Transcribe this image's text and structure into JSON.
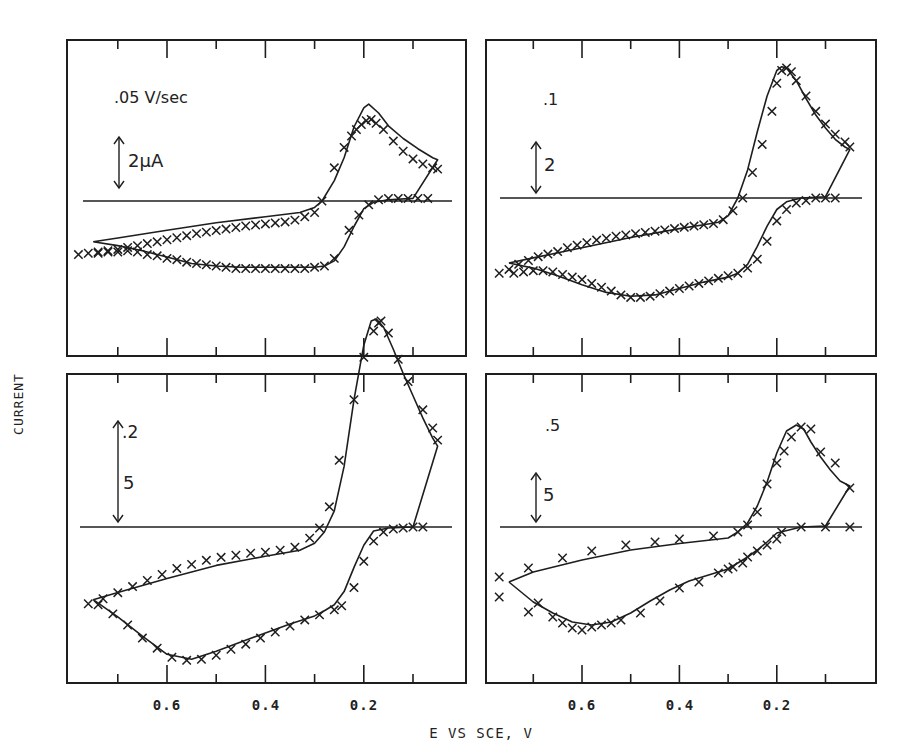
{
  "figure": {
    "ylabel": "CURRENT",
    "xlabel": "E VS SCE, V",
    "colors": {
      "ink": "#1e1e1e",
      "background": "#ffffff"
    }
  },
  "chart_data": [
    {
      "type": "line",
      "panel": "top-left",
      "title": ".05 V/sec",
      "scale_bar_label": "2μA",
      "scale_bar_value": 2,
      "xlabel": "E VS SCE, V",
      "ylabel": "CURRENT",
      "xlim": [
        0.8,
        0.0
      ],
      "x_ticks": [
        0.6,
        0.4,
        0.2
      ],
      "x_tick_labels": [],
      "series": [
        {
          "name": "simulated (solid line)",
          "style": "line",
          "x": [
            0.75,
            0.7,
            0.6,
            0.5,
            0.4,
            0.33,
            0.3,
            0.285,
            0.26,
            0.24,
            0.22,
            0.2,
            0.19,
            0.17,
            0.15,
            0.12,
            0.09,
            0.06,
            0.05,
            0.1,
            0.15,
            0.18,
            0.2,
            0.22,
            0.24,
            0.26,
            0.28,
            0.3,
            0.35,
            0.4,
            0.45,
            0.5,
            0.55,
            0.6,
            0.65,
            0.7,
            0.75
          ],
          "y": [
            -1.6,
            -1.45,
            -1.15,
            -0.85,
            -0.62,
            -0.45,
            -0.25,
            0.0,
            0.8,
            1.7,
            2.9,
            3.65,
            3.8,
            3.45,
            2.95,
            2.45,
            2.05,
            1.7,
            1.62,
            0.1,
            0.05,
            -0.05,
            -0.3,
            -1.0,
            -1.8,
            -2.35,
            -2.55,
            -2.6,
            -2.6,
            -2.6,
            -2.6,
            -2.55,
            -2.45,
            -2.2,
            -1.95,
            -1.75,
            -1.6
          ]
        },
        {
          "name": "experimental (x markers)",
          "style": "markers",
          "x": [
            0.78,
            0.76,
            0.74,
            0.72,
            0.7,
            0.68,
            0.66,
            0.64,
            0.62,
            0.6,
            0.58,
            0.56,
            0.54,
            0.52,
            0.5,
            0.48,
            0.46,
            0.44,
            0.42,
            0.4,
            0.38,
            0.36,
            0.34,
            0.32,
            0.3,
            0.285,
            0.26,
            0.24,
            0.225,
            0.215,
            0.205,
            0.195,
            0.185,
            0.175,
            0.16,
            0.14,
            0.12,
            0.1,
            0.08,
            0.06,
            0.05,
            0.07,
            0.09,
            0.11,
            0.13,
            0.15,
            0.17,
            0.19,
            0.21,
            0.23,
            0.26,
            0.28,
            0.3,
            0.32,
            0.34,
            0.36,
            0.38,
            0.4,
            0.42,
            0.44,
            0.46,
            0.48,
            0.5,
            0.52,
            0.54,
            0.56,
            0.58,
            0.6,
            0.62,
            0.64,
            0.66,
            0.68,
            0.7,
            0.72,
            0.74
          ],
          "y": [
            -2.1,
            -2.05,
            -2.0,
            -1.95,
            -1.9,
            -1.82,
            -1.75,
            -1.67,
            -1.6,
            -1.52,
            -1.44,
            -1.36,
            -1.28,
            -1.22,
            -1.16,
            -1.1,
            -1.04,
            -0.98,
            -0.94,
            -0.9,
            -0.86,
            -0.82,
            -0.75,
            -0.62,
            -0.45,
            0.0,
            1.3,
            2.1,
            2.55,
            2.8,
            3.0,
            3.15,
            3.2,
            3.05,
            2.8,
            2.35,
            1.95,
            1.65,
            1.45,
            1.3,
            1.25,
            0.1,
            0.1,
            0.1,
            0.1,
            0.1,
            0.05,
            -0.15,
            -0.55,
            -1.15,
            -2.25,
            -2.55,
            -2.6,
            -2.65,
            -2.65,
            -2.65,
            -2.65,
            -2.65,
            -2.65,
            -2.65,
            -2.65,
            -2.6,
            -2.55,
            -2.5,
            -2.45,
            -2.4,
            -2.3,
            -2.25,
            -2.15,
            -2.1,
            -2.0,
            -1.95,
            -2.0,
            -2.0,
            -2.05
          ]
        }
      ]
    },
    {
      "type": "line",
      "panel": "top-right",
      "title": ".1",
      "scale_bar_label": "2",
      "scale_bar_value": 2,
      "xlim": [
        0.8,
        0.0
      ],
      "x_ticks": [
        0.6,
        0.4,
        0.2
      ],
      "x_tick_labels": [],
      "series": [
        {
          "name": "simulated (solid line)",
          "style": "line",
          "x": [
            0.75,
            0.7,
            0.6,
            0.5,
            0.4,
            0.35,
            0.32,
            0.3,
            0.28,
            0.26,
            0.24,
            0.22,
            0.2,
            0.19,
            0.18,
            0.16,
            0.14,
            0.12,
            0.1,
            0.08,
            0.06,
            0.05,
            0.1,
            0.15,
            0.18,
            0.2,
            0.22,
            0.24,
            0.26,
            0.28,
            0.3,
            0.35,
            0.4,
            0.45,
            0.5,
            0.55,
            0.6,
            0.65,
            0.7,
            0.75
          ],
          "y": [
            -2.55,
            -2.35,
            -1.95,
            -1.55,
            -1.2,
            -1.05,
            -0.95,
            -0.7,
            0.0,
            1.1,
            2.6,
            4.0,
            5.0,
            5.15,
            5.1,
            4.6,
            3.9,
            3.25,
            2.75,
            2.3,
            2.0,
            1.9,
            0.05,
            0.0,
            -0.15,
            -0.45,
            -1.1,
            -1.9,
            -2.6,
            -2.95,
            -3.1,
            -3.3,
            -3.55,
            -3.8,
            -3.85,
            -3.7,
            -3.4,
            -3.05,
            -2.75,
            -2.55
          ]
        },
        {
          "name": "experimental (x markers)",
          "style": "markers",
          "x": [
            0.77,
            0.75,
            0.73,
            0.71,
            0.69,
            0.67,
            0.65,
            0.63,
            0.61,
            0.59,
            0.57,
            0.55,
            0.53,
            0.51,
            0.49,
            0.47,
            0.45,
            0.43,
            0.41,
            0.39,
            0.37,
            0.35,
            0.33,
            0.31,
            0.29,
            0.27,
            0.25,
            0.23,
            0.21,
            0.2,
            0.19,
            0.18,
            0.17,
            0.16,
            0.14,
            0.12,
            0.1,
            0.08,
            0.06,
            0.05,
            0.08,
            0.1,
            0.12,
            0.14,
            0.16,
            0.18,
            0.2,
            0.22,
            0.24,
            0.26,
            0.28,
            0.3,
            0.32,
            0.34,
            0.36,
            0.38,
            0.4,
            0.42,
            0.44,
            0.46,
            0.48,
            0.5,
            0.52,
            0.54,
            0.56,
            0.58,
            0.6,
            0.62,
            0.64,
            0.66,
            0.68,
            0.7,
            0.72,
            0.74
          ],
          "y": [
            -2.95,
            -2.8,
            -2.6,
            -2.45,
            -2.3,
            -2.2,
            -2.1,
            -1.95,
            -1.85,
            -1.75,
            -1.65,
            -1.58,
            -1.5,
            -1.45,
            -1.4,
            -1.35,
            -1.3,
            -1.25,
            -1.2,
            -1.15,
            -1.1,
            -1.05,
            -1.0,
            -0.85,
            -0.5,
            0.0,
            1.0,
            2.1,
            3.4,
            4.5,
            5.0,
            5.1,
            4.95,
            4.6,
            4.0,
            3.4,
            2.9,
            2.5,
            2.2,
            2.0,
            0.0,
            0.0,
            0.0,
            -0.1,
            -0.2,
            -0.45,
            -0.9,
            -1.7,
            -2.4,
            -2.75,
            -2.95,
            -3.05,
            -3.15,
            -3.25,
            -3.35,
            -3.45,
            -3.55,
            -3.65,
            -3.75,
            -3.85,
            -3.9,
            -3.9,
            -3.8,
            -3.65,
            -3.5,
            -3.35,
            -3.2,
            -3.1,
            -3.0,
            -2.9,
            -2.85,
            -2.85,
            -2.9,
            -2.95
          ]
        }
      ]
    },
    {
      "type": "line",
      "panel": "bottom-left",
      "title": ".2",
      "scale_bar_label": "5",
      "scale_bar_value": 5,
      "xlim": [
        0.8,
        0.0
      ],
      "x_ticks": [
        0.6,
        0.4,
        0.2
      ],
      "x_tick_labels": [
        "0.6",
        "0.4",
        "0.2"
      ],
      "series": [
        {
          "name": "simulated (solid line)",
          "style": "line",
          "x": [
            0.75,
            0.7,
            0.6,
            0.5,
            0.4,
            0.33,
            0.3,
            0.28,
            0.26,
            0.24,
            0.22,
            0.2,
            0.185,
            0.175,
            0.16,
            0.14,
            0.12,
            0.1,
            0.08,
            0.06,
            0.05,
            0.1,
            0.15,
            0.18,
            0.2,
            0.22,
            0.24,
            0.26,
            0.28,
            0.3,
            0.35,
            0.4,
            0.45,
            0.5,
            0.55,
            0.6,
            0.65,
            0.7,
            0.75
          ],
          "y": [
            -3.6,
            -3.25,
            -2.55,
            -1.9,
            -1.45,
            -1.15,
            -0.8,
            -0.25,
            0.8,
            3.0,
            6.3,
            9.0,
            10.2,
            10.3,
            9.9,
            8.8,
            7.6,
            6.5,
            5.4,
            4.4,
            4.0,
            0.0,
            -0.05,
            -0.2,
            -0.9,
            -2.0,
            -3.2,
            -3.85,
            -4.15,
            -4.4,
            -4.8,
            -5.25,
            -5.7,
            -6.15,
            -6.55,
            -6.3,
            -5.4,
            -4.45,
            -3.6
          ]
        },
        {
          "name": "experimental (x markers)",
          "style": "markers",
          "x": [
            0.76,
            0.73,
            0.7,
            0.67,
            0.64,
            0.61,
            0.58,
            0.55,
            0.52,
            0.49,
            0.46,
            0.43,
            0.4,
            0.37,
            0.34,
            0.31,
            0.29,
            0.27,
            0.25,
            0.22,
            0.2,
            0.18,
            0.17,
            0.165,
            0.15,
            0.13,
            0.11,
            0.08,
            0.06,
            0.05,
            0.08,
            0.1,
            0.12,
            0.14,
            0.16,
            0.18,
            0.2,
            0.22,
            0.245,
            0.26,
            0.29,
            0.32,
            0.35,
            0.38,
            0.41,
            0.44,
            0.47,
            0.5,
            0.53,
            0.56,
            0.59,
            0.62,
            0.65,
            0.68,
            0.71,
            0.74
          ],
          "y": [
            -3.8,
            -3.55,
            -3.25,
            -2.95,
            -2.65,
            -2.35,
            -2.05,
            -1.85,
            -1.65,
            -1.5,
            -1.4,
            -1.3,
            -1.25,
            -1.15,
            -1.0,
            -0.55,
            -0.05,
            1.0,
            3.3,
            6.3,
            8.4,
            9.7,
            10.1,
            10.2,
            9.6,
            8.3,
            7.2,
            5.8,
            4.9,
            4.3,
            0.0,
            0.0,
            -0.05,
            -0.1,
            -0.25,
            -0.7,
            -1.7,
            -3.0,
            -3.9,
            -4.1,
            -4.35,
            -4.6,
            -4.9,
            -5.2,
            -5.5,
            -5.8,
            -6.05,
            -6.35,
            -6.55,
            -6.6,
            -6.45,
            -6.0,
            -5.5,
            -4.85,
            -4.3,
            -3.85
          ]
        }
      ]
    },
    {
      "type": "line",
      "panel": "bottom-right",
      "title": ".5",
      "scale_bar_label": "5",
      "scale_bar_value": 5,
      "xlim": [
        0.8,
        0.0
      ],
      "x_ticks": [
        0.6,
        0.4,
        0.2
      ],
      "x_tick_labels": [
        "0.6",
        "0.4",
        "0.2"
      ],
      "series": [
        {
          "name": "simulated (solid line)",
          "style": "line",
          "x": [
            0.75,
            0.7,
            0.6,
            0.5,
            0.4,
            0.3,
            0.28,
            0.26,
            0.24,
            0.22,
            0.2,
            0.18,
            0.16,
            0.145,
            0.13,
            0.11,
            0.09,
            0.07,
            0.05,
            0.1,
            0.15,
            0.2,
            0.22,
            0.24,
            0.26,
            0.28,
            0.3,
            0.34,
            0.38,
            0.42,
            0.46,
            0.5,
            0.54,
            0.58,
            0.62,
            0.66,
            0.7,
            0.75
          ],
          "y": [
            -5.5,
            -4.5,
            -3.3,
            -2.3,
            -1.65,
            -1.1,
            -0.5,
            0.4,
            2.1,
            4.5,
            7.4,
            9.6,
            10.2,
            9.8,
            8.5,
            7.0,
            5.7,
            4.6,
            4.1,
            0.1,
            0.0,
            -0.6,
            -1.5,
            -2.3,
            -3.0,
            -3.6,
            -4.2,
            -4.8,
            -5.4,
            -6.3,
            -7.4,
            -8.6,
            -9.5,
            -9.8,
            -9.5,
            -8.6,
            -7.5,
            -5.5
          ]
        },
        {
          "name": "experimental (x markers)",
          "style": "markers",
          "x": [
            0.77,
            0.71,
            0.64,
            0.58,
            0.51,
            0.45,
            0.4,
            0.33,
            0.28,
            0.26,
            0.24,
            0.22,
            0.2,
            0.185,
            0.17,
            0.15,
            0.13,
            0.11,
            0.08,
            0.05,
            0.05,
            0.1,
            0.15,
            0.19,
            0.2,
            0.22,
            0.24,
            0.26,
            0.27,
            0.29,
            0.3,
            0.32,
            0.36,
            0.4,
            0.44,
            0.48,
            0.52,
            0.54,
            0.56,
            0.58,
            0.6,
            0.62,
            0.64,
            0.66,
            0.69,
            0.71,
            0.77
          ],
          "y": [
            -5.0,
            -4.1,
            -3.1,
            -2.4,
            -1.8,
            -1.5,
            -1.2,
            -0.9,
            -0.5,
            0.2,
            1.5,
            4.3,
            6.4,
            7.6,
            9.0,
            10.0,
            9.8,
            7.5,
            6.4,
            3.9,
            0.0,
            0.0,
            0.0,
            -0.5,
            -1.2,
            -1.8,
            -2.4,
            -3.0,
            -3.6,
            -4.0,
            -4.2,
            -4.6,
            -5.5,
            -6.1,
            -7.4,
            -8.6,
            -9.3,
            -9.6,
            -9.8,
            -10.0,
            -10.3,
            -10.1,
            -9.6,
            -9.0,
            -7.6,
            -8.5,
            -7.0
          ]
        }
      ]
    }
  ]
}
